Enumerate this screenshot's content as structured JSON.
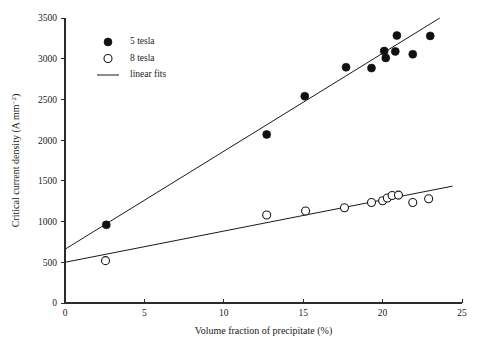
{
  "chart_data": {
    "type": "scatter",
    "title": "",
    "xlabel": "Volume fraction of precipitate (%)",
    "ylabel": "Critical current density (A mm−2)",
    "ylabel_base": "Critical current density (A mm",
    "ylabel_sup": "−2",
    "ylabel_tail": ")",
    "xlim": [
      0,
      25
    ],
    "ylim": [
      0,
      3500
    ],
    "xticks": [
      0,
      5,
      10,
      15,
      20,
      25
    ],
    "yticks": [
      0,
      500,
      1000,
      1500,
      2000,
      2500,
      3000,
      3500
    ],
    "xticklabels": [
      "0",
      "5",
      "10",
      "15",
      "20",
      "25"
    ],
    "yticklabels": [
      "0",
      "500",
      "1000",
      "1500",
      "2000",
      "2500",
      "3000",
      "3500"
    ],
    "grid": false,
    "legend_position": "upper-left",
    "series": [
      {
        "name": "5 tesla",
        "marker": "filled-circle",
        "color": "#111111",
        "points": [
          {
            "x": 2.6,
            "y": 960
          },
          {
            "x": 12.7,
            "y": 2070
          },
          {
            "x": 15.1,
            "y": 2540
          },
          {
            "x": 17.7,
            "y": 2895
          },
          {
            "x": 19.3,
            "y": 2885
          },
          {
            "x": 20.1,
            "y": 3095
          },
          {
            "x": 20.2,
            "y": 3010
          },
          {
            "x": 20.8,
            "y": 3090
          },
          {
            "x": 20.9,
            "y": 3285
          },
          {
            "x": 21.9,
            "y": 3055
          },
          {
            "x": 23.0,
            "y": 3280
          }
        ]
      },
      {
        "name": "8 tesla",
        "marker": "open-circle",
        "color": "#1a1a1a",
        "points": [
          {
            "x": 2.55,
            "y": 520
          },
          {
            "x": 12.7,
            "y": 1080
          },
          {
            "x": 15.15,
            "y": 1130
          },
          {
            "x": 17.6,
            "y": 1170
          },
          {
            "x": 19.3,
            "y": 1235
          },
          {
            "x": 20.0,
            "y": 1255
          },
          {
            "x": 20.3,
            "y": 1290
          },
          {
            "x": 20.6,
            "y": 1320
          },
          {
            "x": 21.0,
            "y": 1325
          },
          {
            "x": 21.9,
            "y": 1235
          },
          {
            "x": 22.9,
            "y": 1280
          }
        ]
      }
    ],
    "fits": [
      {
        "name": "linear fit 5 tesla",
        "x_start": 0.0,
        "y_start": 660,
        "x_end": 23.6,
        "y_end": 3500
      },
      {
        "name": "linear fit 8 tesla",
        "x_start": 0.0,
        "y_start": 500,
        "x_end": 24.4,
        "y_end": 1435
      }
    ],
    "legend": [
      {
        "label": "5 tesla",
        "marker": "filled-circle"
      },
      {
        "label": "8 tesla",
        "marker": "open-circle"
      },
      {
        "label": "linear fits",
        "marker": "line"
      }
    ]
  }
}
